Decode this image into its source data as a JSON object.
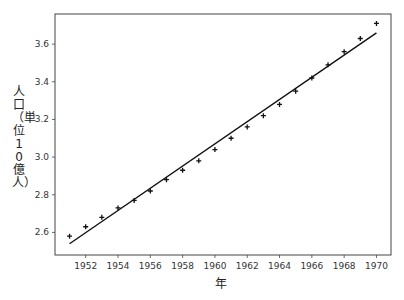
{
  "chart_data": {
    "type": "scatter",
    "title": "",
    "xlabel": "年",
    "ylabel": "人口（単位10億人）",
    "xlim": [
      1950.1,
      1970.9
    ],
    "ylim": [
      2.48,
      3.76
    ],
    "grid": false,
    "x_ticks": [
      1952,
      1954,
      1956,
      1958,
      1960,
      1962,
      1964,
      1966,
      1968,
      1970
    ],
    "y_ticks": [
      2.6,
      2.8,
      3.0,
      3.2,
      3.4,
      3.6
    ],
    "series": [
      {
        "name": "population",
        "marker": "+",
        "x": [
          1951,
          1952,
          1953,
          1954,
          1955,
          1956,
          1957,
          1958,
          1959,
          1960,
          1961,
          1962,
          1963,
          1964,
          1965,
          1966,
          1967,
          1968,
          1969,
          1970
        ],
        "values": [
          2.58,
          2.63,
          2.68,
          2.73,
          2.77,
          2.82,
          2.88,
          2.93,
          2.98,
          3.04,
          3.1,
          3.16,
          3.22,
          3.28,
          3.35,
          3.42,
          3.49,
          3.56,
          3.63,
          3.71
        ]
      },
      {
        "name": "linear fit",
        "type": "line",
        "x": [
          1951,
          1970
        ],
        "values": [
          2.54,
          3.66
        ]
      }
    ]
  },
  "labels": {
    "xlabel": "年",
    "ylabel": "人口（単位10億人）"
  }
}
